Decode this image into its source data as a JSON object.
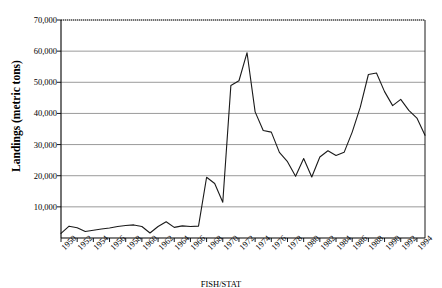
{
  "chart_data": {
    "type": "line",
    "title": "",
    "xlabel": "",
    "ylabel": "Landings (metric tons)",
    "ylim": [
      0,
      70000
    ],
    "xlim": [
      1950,
      1995
    ],
    "grid": true,
    "legend": null,
    "y_ticks": [
      "10,000",
      "20,000",
      "30,000",
      "40,000",
      "50,000",
      "60,000",
      "70,000"
    ],
    "y_tick_values": [
      10000,
      20000,
      30000,
      40000,
      50000,
      60000,
      70000
    ],
    "x_ticks": [
      "1950",
      "1952",
      "1954",
      "1956",
      "1958",
      "1960",
      "1962",
      "1964",
      "1966",
      "1968",
      "1970",
      "1972",
      "1974",
      "1976",
      "1978",
      "1980",
      "1982",
      "1984",
      "1986",
      "1988",
      "1990",
      "1992",
      "1994"
    ],
    "x_tick_values": [
      1950,
      1952,
      1954,
      1956,
      1958,
      1960,
      1962,
      1964,
      1966,
      1968,
      1970,
      1972,
      1974,
      1976,
      1978,
      1980,
      1982,
      1984,
      1986,
      1988,
      1990,
      1992,
      1994
    ],
    "x": [
      1950,
      1951,
      1952,
      1953,
      1954,
      1955,
      1956,
      1957,
      1958,
      1959,
      1960,
      1961,
      1962,
      1963,
      1964,
      1965,
      1966,
      1967,
      1968,
      1969,
      1970,
      1971,
      1972,
      1973,
      1974,
      1975,
      1976,
      1977,
      1978,
      1979,
      1980,
      1981,
      1982,
      1983,
      1984,
      1985,
      1986,
      1987,
      1988,
      1989,
      1990,
      1991,
      1992,
      1993,
      1994,
      1995
    ],
    "values": [
      1500,
      3800,
      3300,
      2100,
      2500,
      2900,
      3200,
      3700,
      4000,
      4200,
      3700,
      1600,
      3700,
      5200,
      3400,
      3900,
      3700,
      3800,
      19500,
      17500,
      11500,
      49000,
      50500,
      59500,
      40500,
      34500,
      34000,
      27500,
      24500,
      19800,
      25500,
      19600,
      26000,
      28000,
      26500,
      27500,
      34000,
      42000,
      52500,
      53000,
      47000,
      42500,
      44500,
      41000,
      38500,
      33000
    ],
    "series_color": "#1a1a1a",
    "grid_color": "#808080",
    "axis_color": "#000000",
    "plot_background": "#ffffff"
  },
  "caption": {
    "text": "FISH/STAT"
  }
}
